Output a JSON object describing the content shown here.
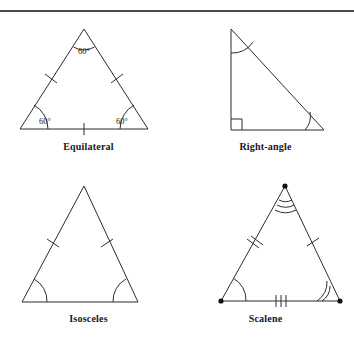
{
  "figure": {
    "divider": "horizontal-rule",
    "panels": [
      {
        "id": "equilateral",
        "caption": "Equilateral",
        "position": "top-left",
        "vertices": {
          "apex": [
            84,
            29
          ],
          "bottom_left": [
            20,
            129
          ],
          "bottom_right": [
            148,
            129
          ]
        },
        "angle_labels": [
          {
            "text": "60°",
            "at": "apex",
            "x": 84,
            "y": 51
          },
          {
            "text": "60°",
            "at": "bottom-left",
            "x": 45,
            "y": 122
          },
          {
            "text": "60°",
            "at": "bottom-right",
            "x": 122,
            "y": 122
          }
        ],
        "side_ticks": {
          "left": 1,
          "right": 1,
          "base": 1
        },
        "angle_arcs": {
          "apex": 1,
          "bottom_left": 1,
          "bottom_right": 1
        },
        "right_angle_marker": false,
        "vertex_dots": false
      },
      {
        "id": "right-angle",
        "caption": "Right-angle",
        "position": "top-right",
        "vertices": {
          "top_left": [
            54,
            29
          ],
          "bottom_left": [
            54,
            130
          ],
          "bottom_right": [
            147,
            130
          ]
        },
        "angle_labels": [],
        "side_ticks": {
          "left": 0,
          "right": 0,
          "base": 0
        },
        "angle_arcs": {
          "top_left": 1,
          "bottom_right": 1
        },
        "right_angle_marker": true,
        "vertex_dots": false
      },
      {
        "id": "isosceles",
        "caption": "Isosceles",
        "position": "bottom-left",
        "vertices": {
          "apex": [
            84,
            13
          ],
          "bottom_left": [
            22,
            129
          ],
          "bottom_right": [
            138,
            129
          ]
        },
        "angle_labels": [],
        "side_ticks": {
          "left": 1,
          "right": 1,
          "base": 0
        },
        "angle_arcs": {
          "apex": 0,
          "bottom_left": 1,
          "bottom_right": 1
        },
        "right_angle_marker": false,
        "vertex_dots": false
      },
      {
        "id": "scalene",
        "caption": "Scalene",
        "position": "bottom-right",
        "vertices": {
          "apex": [
            108,
            13
          ],
          "bottom_left": [
            44,
            128
          ],
          "bottom_right": [
            163,
            128
          ]
        },
        "angle_labels": [],
        "side_ticks": {
          "left": 2,
          "right": 1,
          "base": 3
        },
        "angle_arcs": {
          "apex": 3,
          "bottom_left": 1,
          "bottom_right": 2
        },
        "right_angle_marker": false,
        "vertex_dots": true
      }
    ]
  },
  "colors": {
    "ink": "#2b2b33",
    "text": "#16161a",
    "rule": "#4a4a50",
    "background": "#ffffff"
  }
}
